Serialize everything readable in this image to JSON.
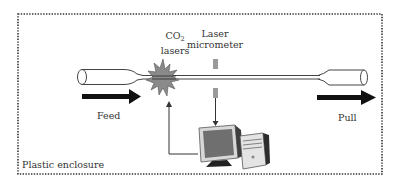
{
  "diagram": {
    "labels": {
      "co2_lasers_line1_main": "CO",
      "co2_lasers_line1_sub": "2",
      "co2_lasers_line2": "lasers",
      "laser_micrometer_line1": "Laser",
      "laser_micrometer_line2": "micrometer",
      "feed": "Feed",
      "pull": "Pull",
      "enclosure": "Plastic enclosure"
    },
    "colors": {
      "border": "#333333",
      "fiber": "#444444",
      "arrow": "#111111",
      "laser_burst": "#8a8a8a",
      "laser_burst_stroke": "#555555",
      "micrometer": "#9a9a9a",
      "monitor": "#6f6f6f",
      "tower": "#3a3a3a"
    }
  }
}
